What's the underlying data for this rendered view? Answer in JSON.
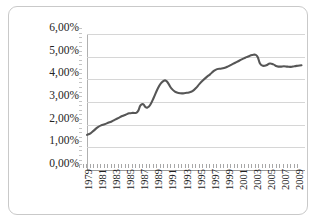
{
  "chart_data": {
    "type": "line",
    "title": "",
    "subtitle": "",
    "xlabel": "",
    "ylabel": "",
    "xlim": [
      1979,
      2010
    ],
    "ylim": [
      0,
      6
    ],
    "grid": true,
    "legend_position": "none",
    "y_tick_labels": [
      "6,00%",
      "5,00%",
      "4,00%",
      "3,00%",
      "2,00%",
      "1,00%",
      "0,00%"
    ],
    "y_tick_values": [
      6,
      5,
      4,
      3,
      2,
      1,
      0
    ],
    "x_tick_labels": [
      "1979",
      "1981",
      "1983",
      "1985",
      "1987",
      "1989",
      "1991",
      "1993",
      "1995",
      "1997",
      "1999",
      "2001",
      "2003",
      "2005",
      "2007",
      "2009"
    ],
    "x_tick_values": [
      1979,
      1981,
      1983,
      1985,
      1987,
      1989,
      1991,
      1993,
      1995,
      1997,
      1999,
      2001,
      2003,
      2005,
      2007,
      2009
    ],
    "series": [
      {
        "name": "Rate",
        "color": "#565656",
        "unit": "%",
        "x": [
          1979,
          1979.5,
          1980,
          1980.5,
          1981,
          1981.5,
          1982,
          1982.5,
          1983,
          1983.5,
          1984,
          1984.5,
          1985,
          1985.5,
          1986,
          1986.3,
          1986.6,
          1987,
          1987.3,
          1987.6,
          1988,
          1988.5,
          1989,
          1989.5,
          1990,
          1990.3,
          1990.6,
          1991,
          1991.5,
          1992,
          1992.5,
          1993,
          1993.5,
          1994,
          1994.5,
          1995,
          1995.5,
          1996,
          1996.5,
          1997,
          1997.5,
          1998,
          1998.5,
          1999,
          1999.5,
          2000,
          2000.5,
          2001,
          2001.5,
          2002,
          2002.5,
          2003,
          2003.3,
          2003.6,
          2004,
          2004.5,
          2005,
          2005.5,
          2006,
          2006.5,
          2007,
          2007.5,
          2008,
          2008.5,
          2009,
          2009.5
        ],
        "values": [
          1.55,
          1.62,
          1.75,
          1.88,
          1.97,
          2.02,
          2.08,
          2.14,
          2.22,
          2.3,
          2.38,
          2.44,
          2.5,
          2.52,
          2.52,
          2.62,
          2.85,
          2.9,
          2.78,
          2.76,
          2.88,
          3.2,
          3.55,
          3.82,
          3.95,
          3.92,
          3.8,
          3.6,
          3.46,
          3.4,
          3.38,
          3.4,
          3.42,
          3.48,
          3.62,
          3.8,
          3.96,
          4.1,
          4.22,
          4.36,
          4.45,
          4.47,
          4.5,
          4.56,
          4.64,
          4.72,
          4.8,
          4.88,
          4.95,
          5.02,
          5.07,
          5.08,
          4.96,
          4.7,
          4.6,
          4.62,
          4.7,
          4.66,
          4.58,
          4.56,
          4.58,
          4.56,
          4.55,
          4.58,
          4.6,
          4.62
        ]
      }
    ]
  },
  "frame": {
    "border_color": "#c9c9c9",
    "grid_color": "#d6d6d6",
    "axis_color": "#9a9a9a",
    "background": "#ffffff"
  }
}
